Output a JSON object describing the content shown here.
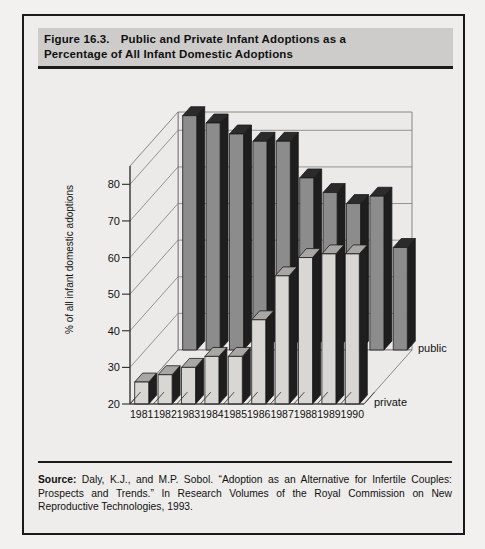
{
  "figure": {
    "title_number": "Figure 16.3.",
    "title_line1": "Public and Private Infant Adoptions as a",
    "title_line2": "Percentage of All Infant Domestic Adoptions",
    "source_label": "Source:",
    "source_text": "Daly, K.J., and M.P. Sobol. “Adoption as an Alternative for Infertile Couples: Prospects and Trends.” In Research Volumes of the Royal Commission on New Reproductive Technologies, 1993."
  },
  "colors": {
    "page_background": "#f2f1ef",
    "figure_background": "#eeedeb",
    "border": "#1a1a1a",
    "title_band": "#cdcccb",
    "public_face": "#8c8c8c",
    "public_top": "#2b2b2b",
    "public_side": "#1e1e1e",
    "private_face": "#d8d7d4",
    "private_top": "#a8a7a4",
    "private_side": "#1e1e1e",
    "wall": "#eceae8",
    "gridline": "#6e6e6e"
  },
  "chart_data": {
    "type": "bar",
    "title": "Public and Private Infant Adoptions as a Percentage of All Infant Domestic Adoptions",
    "xlabel": "",
    "ylabel": "% of all infant domestic adoptions",
    "categories": [
      "1981",
      "1982",
      "1983",
      "1984",
      "1985",
      "1986",
      "1987",
      "1988",
      "1989",
      "1990"
    ],
    "series": [
      {
        "name": "public",
        "values": [
          84,
          82,
          79,
          77,
          77,
          67,
          63,
          60,
          62,
          48
        ]
      },
      {
        "name": "private",
        "values": [
          26,
          28,
          30,
          33,
          33,
          43,
          55,
          60,
          61,
          61
        ]
      }
    ],
    "ylim": [
      20,
      85
    ],
    "yticks": [
      20,
      30,
      40,
      50,
      60,
      70,
      80
    ],
    "ytick_labels": [
      "20",
      "30",
      "40",
      "50",
      "60",
      "70",
      "80"
    ],
    "grid": true,
    "legend_position": "right",
    "projection": "3d-two-row"
  }
}
